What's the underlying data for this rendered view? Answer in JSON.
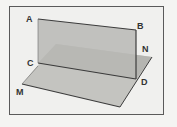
{
  "diagram": {
    "title": "",
    "type": "geometry-dihedral-planes",
    "labels": {
      "A": "A",
      "B": "B",
      "C": "C",
      "D": "D",
      "M": "M",
      "N": "N"
    },
    "colors": {
      "plane_fill": "#b8b8b4",
      "plane_fill_horizontal": "#c4c4c0",
      "edge": "#3c3c3c",
      "frame": "#5a5a5a",
      "background": "#f0f0ee"
    }
  }
}
